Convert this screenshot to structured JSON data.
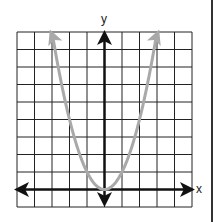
{
  "chart_data": {
    "type": "line",
    "title": "",
    "xlabel": "x",
    "ylabel": "y",
    "equation": "y = x^2",
    "xlim": [
      -5,
      5
    ],
    "ylim": [
      -1,
      9
    ],
    "grid": true,
    "grid_cells": {
      "columns": 10,
      "rows": 10
    },
    "series": [
      {
        "name": "parabola",
        "color": "#a9a9a9",
        "arrows_at_ends": true,
        "x": [
          -3,
          -2.5,
          -2,
          -1.5,
          -1,
          -0.5,
          0,
          0.5,
          1,
          1.5,
          2,
          2.5,
          3
        ],
        "y": [
          9,
          6.25,
          4,
          2.25,
          1,
          0.25,
          0,
          0.25,
          1,
          2.25,
          4,
          6.25,
          9
        ]
      }
    ],
    "vertex": [
      0,
      0
    ],
    "axes": {
      "color": "#111111",
      "arrows": true
    }
  },
  "labels": {
    "x": "x",
    "y": "y"
  },
  "colors": {
    "grid": "#222222",
    "axes": "#111111",
    "curve": "#a9a9a9",
    "background": "#ffffff"
  }
}
